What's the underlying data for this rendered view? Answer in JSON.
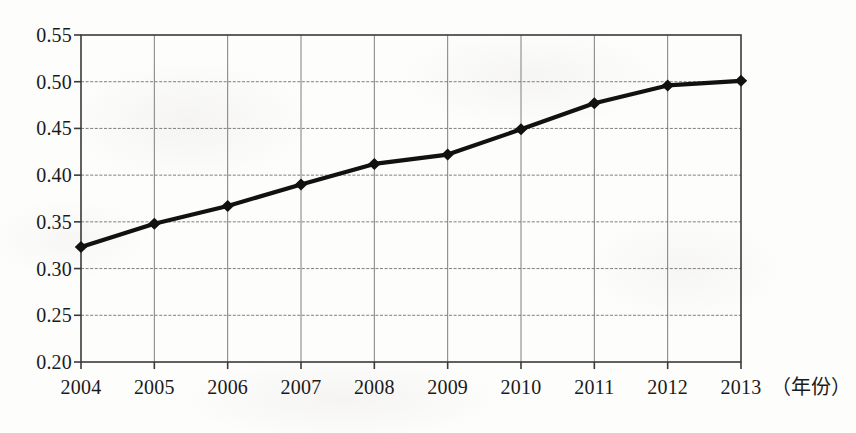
{
  "chart_data": {
    "type": "line",
    "title": "",
    "subtitle": "",
    "xlabel": "（年份）",
    "ylabel": "",
    "categories": [
      "2004",
      "2005",
      "2006",
      "2007",
      "2008",
      "2009",
      "2010",
      "2011",
      "2012",
      "2013"
    ],
    "x": [
      2004,
      2005,
      2006,
      2007,
      2008,
      2009,
      2010,
      2011,
      2012,
      2013
    ],
    "values": [
      0.323,
      0.348,
      0.367,
      0.39,
      0.412,
      0.422,
      0.449,
      0.477,
      0.496,
      0.501
    ],
    "series": [
      {
        "name": "",
        "values": [
          0.323,
          0.348,
          0.367,
          0.39,
          0.412,
          0.422,
          0.449,
          0.477,
          0.496,
          0.501
        ]
      }
    ],
    "ylim": [
      0.2,
      0.55
    ],
    "xlim": [
      2004,
      2013
    ],
    "yticks": [
      "0.20",
      "0.25",
      "0.30",
      "0.35",
      "0.40",
      "0.45",
      "0.50",
      "0.55"
    ],
    "ytick_values": [
      0.2,
      0.25,
      0.3,
      0.35,
      0.4,
      0.45,
      0.5,
      0.55
    ],
    "xticks": [
      "2004",
      "2005",
      "2006",
      "2007",
      "2008",
      "2009",
      "2010",
      "2011",
      "2012",
      "2013"
    ],
    "grid": true,
    "grid_axes": "both",
    "legend": false,
    "legend_position": "none",
    "marker": "diamond",
    "line_color": "#111111",
    "grid_color": "#6a6a6a",
    "axis_color": "#3a3a3a",
    "background_color": "#fdfdfc",
    "annotations": []
  },
  "axis": {
    "x_title": "（年份）"
  }
}
